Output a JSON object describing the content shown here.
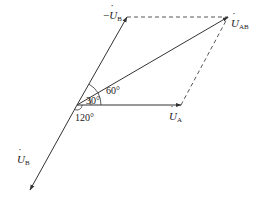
{
  "diagram": {
    "colors": {
      "stroke": "#333333",
      "background": "#ffffff",
      "text": "#222222"
    },
    "origin": [
      77,
      105
    ],
    "vectors": [
      {
        "id": "U_A",
        "label_main": "U",
        "label_sub": "A",
        "prefix": "",
        "from": [
          77,
          105
        ],
        "to": [
          181,
          105
        ],
        "style": "solid"
      },
      {
        "id": "neg_U_B",
        "label_main": "U",
        "label_sub": "B",
        "prefix": "−",
        "from": [
          77,
          105
        ],
        "to": [
          127,
          17
        ],
        "style": "solid"
      },
      {
        "id": "U_B",
        "label_main": "U",
        "label_sub": "B",
        "prefix": "",
        "from": [
          77,
          105
        ],
        "to": [
          30,
          190
        ],
        "style": "solid"
      },
      {
        "id": "U_AB",
        "label_main": "U",
        "label_sub": "AB",
        "prefix": "",
        "from": [
          77,
          105
        ],
        "to": [
          228,
          17
        ],
        "style": "solid"
      }
    ],
    "dashed_lines": [
      {
        "from": [
          127,
          17
        ],
        "to": [
          228,
          17
        ]
      },
      {
        "from": [
          181,
          105
        ],
        "to": [
          228,
          17
        ]
      }
    ],
    "angles": [
      {
        "label": "60°"
      },
      {
        "label": "30°"
      },
      {
        "label": "120°"
      }
    ]
  }
}
